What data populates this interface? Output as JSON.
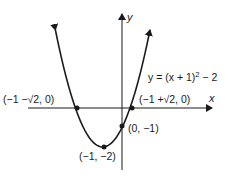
{
  "chart_data": {
    "type": "line",
    "title": "",
    "equation": "y = (x + 1)² − 2",
    "xlabel": "x",
    "ylabel": "y",
    "grid": false,
    "legend": "none",
    "series": [
      {
        "name": "y = (x + 1)^2 - 2",
        "function": "(x+1)^2 - 2",
        "x_range": [
          -3.45,
          1.45
        ]
      }
    ],
    "points": [
      {
        "label": "(−1 −√2, 0)",
        "x": -2.414,
        "y": 0,
        "role": "left-x-intercept"
      },
      {
        "label": "(−1 +√2, 0)",
        "x": 0.414,
        "y": 0,
        "role": "right-x-intercept"
      },
      {
        "label": "(0, −1)",
        "x": 0,
        "y": -1,
        "role": "y-intercept"
      },
      {
        "label": "(−1, −2)",
        "x": -1,
        "y": -2,
        "role": "vertex"
      }
    ]
  },
  "labels": {
    "y_axis": "y",
    "x_axis": "x",
    "equation_prefix": "y = (x + 1)",
    "equation_exp": "2",
    "equation_suffix": " − 2",
    "left_root": "(−1 −√2, 0)",
    "right_root": "(−1 +√2, 0)",
    "y_intercept": "(0, −1)",
    "vertex": "(−1, −2)"
  }
}
